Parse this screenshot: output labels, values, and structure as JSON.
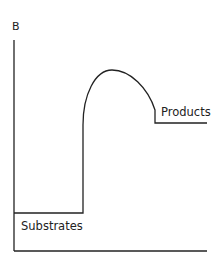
{
  "diagram": {
    "type": "energy-profile",
    "axis_label": "B",
    "labels": {
      "substrates": "Substrates",
      "products": "Products"
    },
    "colors": {
      "line": "#222222",
      "background": "#ffffff"
    },
    "geometry": {
      "y_axis": {
        "x": 14,
        "y_top": 40,
        "y_bottom": 251
      },
      "x_axis": {
        "y": 251,
        "x_left": 14,
        "x_right": 207
      },
      "substrate_level": {
        "y": 213,
        "x_start": 14,
        "x_end": 83
      },
      "transition_peak": {
        "x": 112,
        "y": 70
      },
      "product_level": {
        "y": 123,
        "x_start": 155,
        "x_end": 207
      }
    }
  }
}
